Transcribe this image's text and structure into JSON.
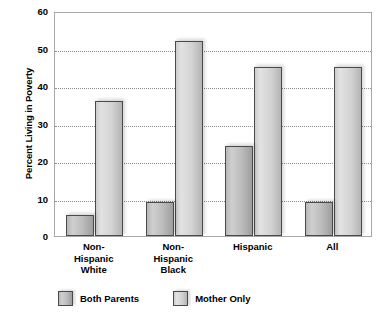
{
  "top_caption": "",
  "chart_data": {
    "type": "bar",
    "title": "",
    "subtitle": "",
    "xlabel": "",
    "ylabel": "Percent Living in Poverty",
    "ylim": [
      0,
      60
    ],
    "yticks": [
      0,
      10,
      20,
      30,
      40,
      50,
      60
    ],
    "ytick_labels": [
      "0",
      "10",
      "20",
      "30",
      "40",
      "50",
      "60"
    ],
    "grid": true,
    "grid_axis": "y",
    "grid_style": "dotted",
    "legend_position": "bottom-left",
    "categories": [
      "Non-Hispanic White",
      "Non-Hispanic Black",
      "Hispanic",
      "All"
    ],
    "category_label_lines": [
      [
        "Non-",
        "Hispanic",
        "White"
      ],
      [
        "Non-",
        "Hispanic",
        "Black"
      ],
      [
        "Hispanic"
      ],
      [
        "All"
      ]
    ],
    "series": [
      {
        "name": "Both Parents",
        "color": "#bdbdbd",
        "values": [
          5.5,
          9,
          24,
          9
        ]
      },
      {
        "name": "Mother Only",
        "color": "#d6d6d6",
        "values": [
          36,
          52,
          45,
          45
        ]
      }
    ]
  }
}
